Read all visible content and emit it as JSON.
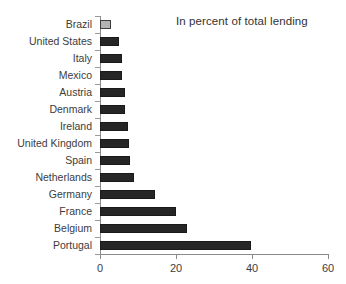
{
  "chart_data": {
    "type": "bar",
    "orientation": "horizontal",
    "title": "In percent of total lending",
    "xlabel": "",
    "ylabel": "",
    "xlim": [
      0,
      60
    ],
    "xticks": [
      0,
      20,
      40,
      60
    ],
    "xtick_labels": [
      "0",
      "20",
      "40",
      "60"
    ],
    "grid": false,
    "legend": null,
    "categories": [
      "Brazil",
      "United States",
      "Italy",
      "Mexico",
      "Austria",
      "Denmark",
      "Ireland",
      "United Kingdom",
      "Spain",
      "Netherlands",
      "Germany",
      "France",
      "Belgium",
      "Portugal"
    ],
    "values": [
      3,
      5,
      5.8,
      5.8,
      6.6,
      6.6,
      7.3,
      7.5,
      8,
      9,
      14.5,
      20,
      23,
      39.7
    ],
    "bar_colors": [
      "#b3b3b3",
      "#262626",
      "#262626",
      "#262626",
      "#262626",
      "#262626",
      "#262626",
      "#262626",
      "#262626",
      "#262626",
      "#262626",
      "#262626",
      "#262626",
      "#262626"
    ],
    "highlighted_category": "Brazil",
    "series": [
      {
        "name": "Share of total lending",
        "values": [
          3,
          5,
          5.8,
          5.8,
          6.6,
          6.6,
          7.3,
          7.5,
          8,
          9,
          14.5,
          20,
          23,
          39.7
        ]
      }
    ]
  },
  "colors": {
    "bar_default": "#262626",
    "bar_highlight": "#b3b3b3",
    "axis": "#8a8a8a",
    "text": "#3c3c3c",
    "background": "#ffffff"
  }
}
